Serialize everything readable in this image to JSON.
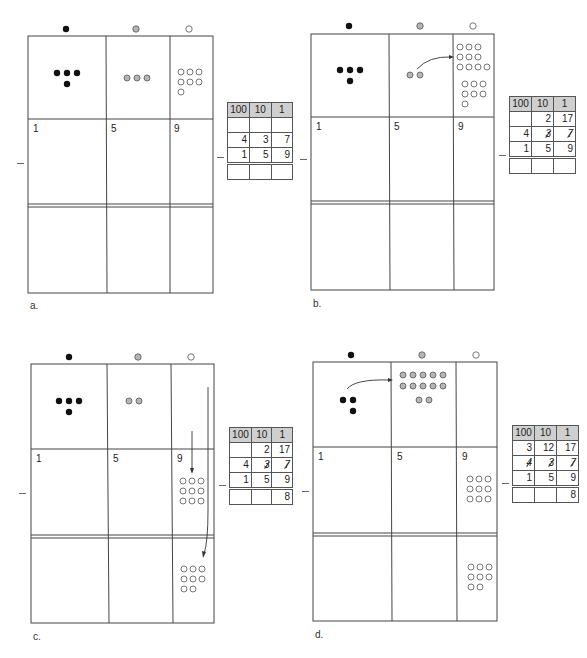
{
  "colors": {
    "hundreds_chip": "#111111",
    "tens_chip": "#b5b5b5",
    "ones_chip": "#ffffff",
    "chip_stroke": "#555555",
    "grid_line": "#444444",
    "table_header_bg": "#cfcfcf"
  },
  "column_icons": [
    "filled-black-circle",
    "gray-circle",
    "white-circle"
  ],
  "panels": [
    {
      "id": "a",
      "label": "a.",
      "place_numbers": {
        "hundreds": "1",
        "tens": "5",
        "ones": "9"
      },
      "table": {
        "headers": [
          "100",
          "10",
          "1"
        ],
        "regroup_row": [
          "",
          "",
          ""
        ],
        "minuend_row": [
          "4",
          "3",
          "7"
        ],
        "minuend_struck": [
          false,
          false,
          false
        ],
        "subtrahend_row": [
          "1",
          "5",
          "9"
        ],
        "result_row": [
          "",
          "",
          ""
        ]
      },
      "minus_sign": "−"
    },
    {
      "id": "b",
      "label": "b.",
      "place_numbers": {
        "hundreds": "1",
        "tens": "5",
        "ones": "9"
      },
      "table": {
        "headers": [
          "100",
          "10",
          "1"
        ],
        "regroup_row": [
          "",
          "2",
          "17"
        ],
        "minuend_row": [
          "4",
          "3",
          "7"
        ],
        "minuend_struck": [
          false,
          true,
          true
        ],
        "subtrahend_row": [
          "1",
          "5",
          "9"
        ],
        "result_row": [
          "",
          "",
          ""
        ]
      },
      "minus_sign": "−"
    },
    {
      "id": "c",
      "label": "c.",
      "place_numbers": {
        "hundreds": "1",
        "tens": "5",
        "ones": "9"
      },
      "table": {
        "headers": [
          "100",
          "10",
          "1"
        ],
        "regroup_row": [
          "",
          "2",
          "17"
        ],
        "minuend_row": [
          "4",
          "3",
          "7"
        ],
        "minuend_struck": [
          false,
          true,
          true
        ],
        "subtrahend_row": [
          "1",
          "5",
          "9"
        ],
        "result_row": [
          "",
          "",
          "8"
        ]
      },
      "minus_sign": "−"
    },
    {
      "id": "d",
      "label": "d.",
      "place_numbers": {
        "hundreds": "1",
        "tens": "5",
        "ones": "9"
      },
      "table": {
        "headers": [
          "100",
          "10",
          "1"
        ],
        "regroup_row": [
          "3",
          "12",
          "17"
        ],
        "minuend_row": [
          "4",
          "3",
          "7"
        ],
        "minuend_struck": [
          true,
          true,
          true
        ],
        "subtrahend_row": [
          "1",
          "5",
          "9"
        ],
        "result_row": [
          "",
          "",
          "8"
        ]
      },
      "minus_sign": "−"
    }
  ],
  "chip_counts": {
    "a": {
      "top": {
        "hundreds": 4,
        "tens": 3,
        "ones": 7
      },
      "middle_ones": 0,
      "bottom_ones": 0
    },
    "b": {
      "top": {
        "hundreds": 4,
        "tens": 2,
        "ones": 17
      },
      "middle_ones": 0,
      "bottom_ones": 0
    },
    "c": {
      "top": {
        "hundreds": 4,
        "tens": 2,
        "ones": 0
      },
      "middle_ones": 9,
      "bottom_ones": 8
    },
    "d": {
      "top": {
        "hundreds": 3,
        "tens": 12,
        "ones": 0
      },
      "middle_ones": 9,
      "bottom_ones": 8
    }
  }
}
